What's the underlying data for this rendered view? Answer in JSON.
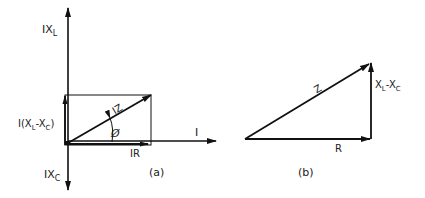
{
  "diagram_a": {
    "caption": "(a)",
    "axis_up_label_main": "IX",
    "axis_up_label_sub": "L",
    "axis_down_label_main": "IX",
    "axis_down_label_sub": "C",
    "axis_right_label": "I",
    "vertical_component_label_prefix": "I(X",
    "vertical_component_label_sub1": "L",
    "vertical_component_label_mid": "-X",
    "vertical_component_label_sub2": "C",
    "vertical_component_label_suffix": ")",
    "resultant_label": "IZ",
    "horizontal_component_label": "IR",
    "angle_label": "Ø"
  },
  "diagram_b": {
    "caption": "(b)",
    "hypotenuse_label": "Z",
    "base_label": "R",
    "vertical_label_main1": "X",
    "vertical_label_sub1": "L",
    "vertical_label_mid": "-X",
    "vertical_label_sub2": "C"
  },
  "colors": {
    "stroke": "#111111",
    "background": "#ffffff"
  }
}
